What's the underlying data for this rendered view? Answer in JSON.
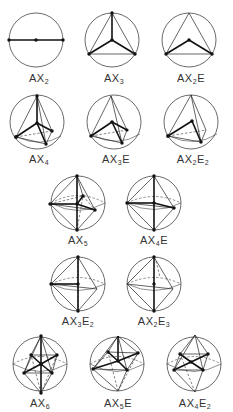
{
  "figures": [
    {
      "id": "AX2",
      "label": {
        "base": "AX",
        "x": "2",
        "e_prefix": "",
        "e": ""
      },
      "geometry": "linear"
    },
    {
      "id": "AX3",
      "label": {
        "base": "AX",
        "x": "3",
        "e_prefix": "",
        "e": ""
      },
      "geometry": "trigonal planar"
    },
    {
      "id": "AX2E",
      "label": {
        "base": "AX",
        "x": "2",
        "e_prefix": "E",
        "e": ""
      },
      "geometry": "bent (trigonal planar parent)"
    },
    {
      "id": "AX4",
      "label": {
        "base": "AX",
        "x": "4",
        "e_prefix": "",
        "e": ""
      },
      "geometry": "tetrahedral"
    },
    {
      "id": "AX3E",
      "label": {
        "base": "AX",
        "x": "3",
        "e_prefix": "E",
        "e": ""
      },
      "geometry": "trigonal pyramidal"
    },
    {
      "id": "AX2E2",
      "label": {
        "base": "AX",
        "x": "2",
        "e_prefix": "E",
        "e": "2"
      },
      "geometry": "bent (tetrahedral parent)"
    },
    {
      "id": "AX5",
      "label": {
        "base": "AX",
        "x": "5",
        "e_prefix": "",
        "e": ""
      },
      "geometry": "trigonal bipyramidal"
    },
    {
      "id": "AX4E",
      "label": {
        "base": "AX",
        "x": "4",
        "e_prefix": "E",
        "e": ""
      },
      "geometry": "seesaw"
    },
    {
      "id": "AX3E2",
      "label": {
        "base": "AX",
        "x": "3",
        "e_prefix": "E",
        "e": "2"
      },
      "geometry": "T-shaped"
    },
    {
      "id": "AX2E3",
      "label": {
        "base": "AX",
        "x": "2",
        "e_prefix": "E",
        "e": "3"
      },
      "geometry": "linear (trigonal bipyramidal parent)"
    },
    {
      "id": "AX6",
      "label": {
        "base": "AX",
        "x": "6",
        "e_prefix": "",
        "e": ""
      },
      "geometry": "octahedral"
    },
    {
      "id": "AX5E",
      "label": {
        "base": "AX",
        "x": "5",
        "e_prefix": "E",
        "e": ""
      },
      "geometry": "square pyramidal"
    },
    {
      "id": "AX4E2",
      "label": {
        "base": "AX",
        "x": "4",
        "e_prefix": "E",
        "e": "2"
      },
      "geometry": "square planar"
    }
  ]
}
